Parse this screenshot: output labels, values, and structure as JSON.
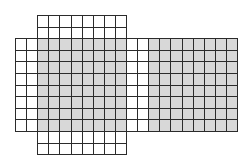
{
  "diagram": {
    "title": "",
    "type": "grid-net",
    "origin_px": [
      15,
      15
    ],
    "cell_px": [
      11.1,
      11.6
    ],
    "columns": 20,
    "rows": 12,
    "colors": {
      "line": "#2b2b2b",
      "shaded": "#d8d8d8",
      "unshaded": "#ffffff"
    },
    "regions": [
      {
        "name": "top-flap",
        "col_start": 2,
        "col_end": 9,
        "row_start": 0,
        "row_end": 1,
        "shaded": false
      },
      {
        "name": "left-strip",
        "col_start": 0,
        "col_end": 1,
        "row_start": 2,
        "row_end": 9,
        "shaded": false
      },
      {
        "name": "center-square",
        "col_start": 2,
        "col_end": 9,
        "row_start": 2,
        "row_end": 9,
        "shaded": true
      },
      {
        "name": "middle-strip",
        "col_start": 10,
        "col_end": 11,
        "row_start": 2,
        "row_end": 9,
        "shaded": false
      },
      {
        "name": "right-square",
        "col_start": 12,
        "col_end": 19,
        "row_start": 2,
        "row_end": 9,
        "shaded": true
      },
      {
        "name": "bottom-flap",
        "col_start": 2,
        "col_end": 9,
        "row_start": 10,
        "row_end": 11,
        "shaded": false
      }
    ]
  }
}
